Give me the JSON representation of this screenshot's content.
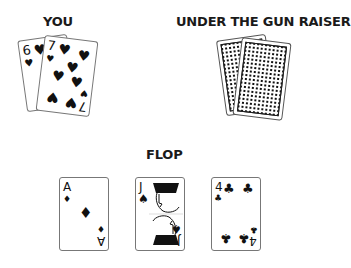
{
  "labels": {
    "you": "YOU",
    "opponent": "UNDER THE GUN RAISER",
    "flop": "FLOP"
  },
  "hole_cards": [
    {
      "rank": "6",
      "suit": "♥",
      "suit_name": "hearts"
    },
    {
      "rank": "7",
      "suit": "♥",
      "suit_name": "hearts"
    }
  ],
  "opponent_cards": [
    {
      "face": "down"
    },
    {
      "face": "down"
    }
  ],
  "flop_cards": [
    {
      "rank": "A",
      "suit": "♦",
      "suit_name": "diamonds"
    },
    {
      "rank": "J",
      "suit": "♠",
      "suit_name": "spades"
    },
    {
      "rank": "4",
      "suit": "♣",
      "suit_name": "clubs"
    }
  ],
  "colors": {
    "ink": "#111111",
    "card_border": "#777777",
    "background": "#ffffff"
  }
}
